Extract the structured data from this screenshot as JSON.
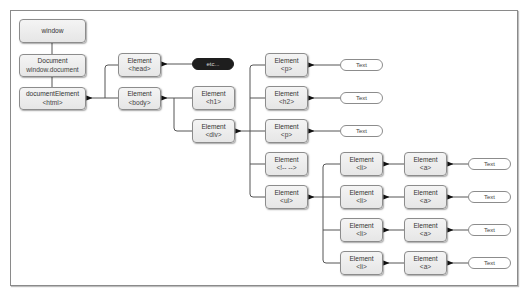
{
  "diagram": {
    "nodes": {
      "window": {
        "line1": "window"
      },
      "document": {
        "line1": "Document",
        "line2": "window.document"
      },
      "html": {
        "line1": "documentElement",
        "line2": "<html>"
      },
      "head": {
        "line1": "Element",
        "line2": "<head>"
      },
      "body": {
        "line1": "Element",
        "line2": "<body>"
      },
      "etc": {
        "line1": "etc..."
      },
      "h1": {
        "line1": "Element",
        "line2": "<h1>"
      },
      "div": {
        "line1": "Element",
        "line2": "<div>"
      },
      "p1": {
        "line1": "Element",
        "line2": "<p>"
      },
      "h2": {
        "line1": "Element",
        "line2": "<h2>"
      },
      "p2": {
        "line1": "Element",
        "line2": "<p>"
      },
      "comment": {
        "line1": "Element",
        "line2": "<!-- -->"
      },
      "ul": {
        "line1": "Element",
        "line2": "<ul>"
      },
      "li": [
        {
          "line1": "Element",
          "line2": "<li>"
        },
        {
          "line1": "Element",
          "line2": "<li>"
        },
        {
          "line1": "Element",
          "line2": "<li>"
        },
        {
          "line1": "Element",
          "line2": "<li>"
        }
      ],
      "a": [
        {
          "line1": "Element",
          "line2": "<a>"
        },
        {
          "line1": "Element",
          "line2": "<a>"
        },
        {
          "line1": "Element",
          "line2": "<a>"
        },
        {
          "line1": "Element",
          "line2": "<a>"
        }
      ],
      "text_p1": {
        "line1": "Text"
      },
      "text_h2": {
        "line1": "Text"
      },
      "text_p2": {
        "line1": "Text"
      },
      "text_a": [
        {
          "line1": "Text"
        },
        {
          "line1": "Text"
        },
        {
          "line1": "Text"
        },
        {
          "line1": "Text"
        }
      ]
    },
    "colors": {
      "node_fill": "#ececec",
      "node_border": "#8c8c8c",
      "line": "#333333",
      "etc_fill": "#1e1e1e"
    }
  }
}
